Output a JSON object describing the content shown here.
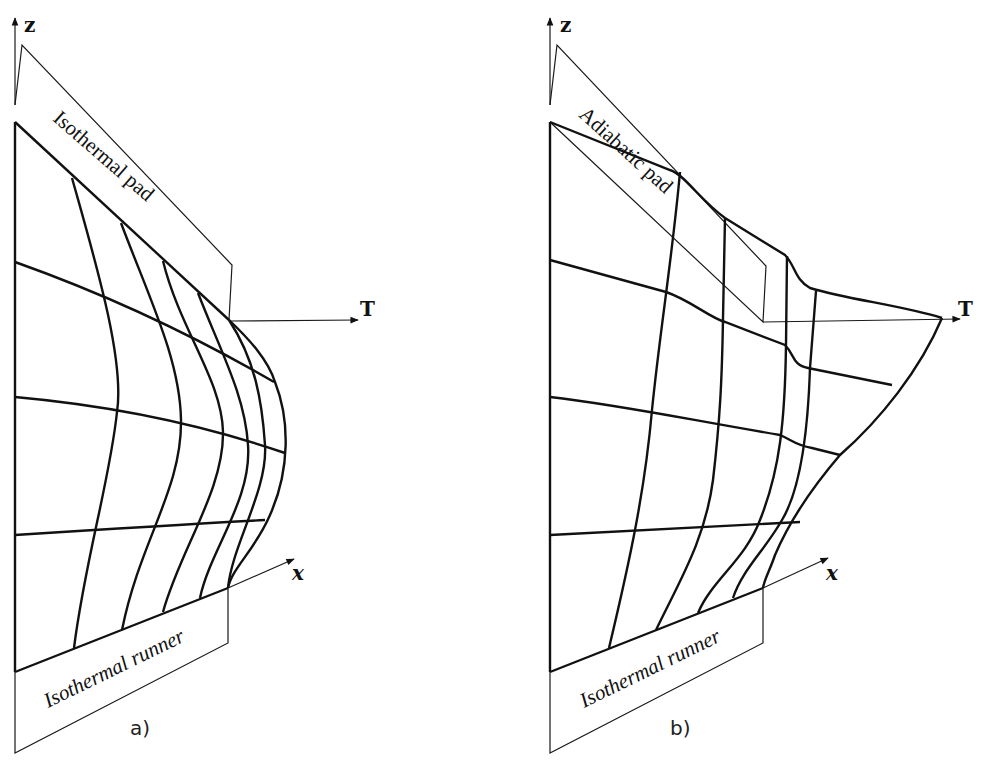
{
  "figure": {
    "panels": [
      {
        "id": "a",
        "caption": "a)",
        "axes": {
          "z": "z",
          "T": "T",
          "x": "x"
        },
        "pad_label": "Isothermal pad",
        "runner_label": "Isothermal runner"
      },
      {
        "id": "b",
        "caption": "b)",
        "axes": {
          "z": "z",
          "T": "T",
          "x": "x"
        },
        "pad_label": "Adiabatic pad",
        "runner_label": "Isothermal runner"
      }
    ]
  }
}
